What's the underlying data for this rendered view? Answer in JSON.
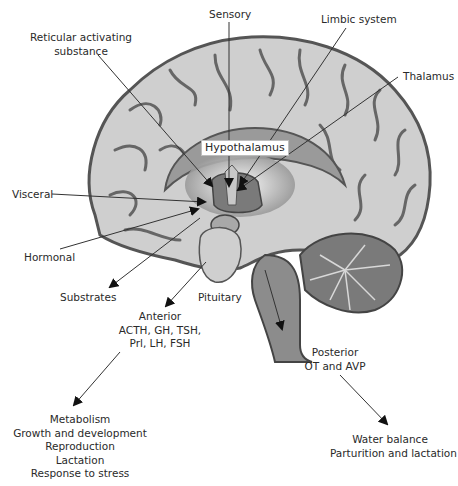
{
  "diagram": {
    "labels": {
      "sensory": "Sensory",
      "limbic_system": "Limbic system",
      "reticular": [
        "Reticular activating",
        "substance"
      ],
      "thalamus": "Thalamus",
      "hypothalamus": "Hypothalamus",
      "visceral": "Visceral",
      "hormonal": "Hormonal",
      "substrates": "Substrates",
      "pituitary": "Pituitary"
    },
    "anterior": {
      "title": "Anterior",
      "hormones": [
        "ACTH, GH, TSH,",
        "Prl, LH, FSH"
      ],
      "effects": [
        "Metabolism",
        "Growth and development",
        "Reproduction",
        "Lactation",
        "Response to stress"
      ]
    },
    "posterior": {
      "title": "Posterior",
      "hormones": [
        "OT and AVP"
      ],
      "effects": [
        "Water balance",
        "Parturition and lactation"
      ]
    },
    "colors": {
      "cortex_fill": "#cfcfcf",
      "cortex_outline": "#555555",
      "deep_fill": "#8a8a8a",
      "line": "#333333"
    }
  }
}
